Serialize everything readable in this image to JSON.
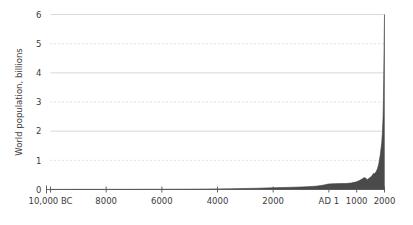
{
  "chart_data": {
    "type": "area",
    "title": "",
    "subtitle": "",
    "xlabel": "",
    "ylabel": "World population, billions",
    "xlim": [
      -10000,
      2000
    ],
    "ylim": [
      0,
      6
    ],
    "grid": true,
    "grid_solid_at": [
      2,
      4,
      6
    ],
    "grid_dotted_at": [
      1,
      3,
      5
    ],
    "legend": "none",
    "fill_color": "#4a4a4a",
    "line_color": "#3a3a3a",
    "grid_color": "#cfcfcf",
    "axis_color": "#555555",
    "background_color": "#ffffff",
    "xticks": [
      {
        "value": -10000,
        "label": "10,000 BC"
      },
      {
        "value": -8000,
        "label": "8000"
      },
      {
        "value": -6000,
        "label": "6000"
      },
      {
        "value": -4000,
        "label": "4000"
      },
      {
        "value": -2000,
        "label": "2000"
      },
      {
        "value": 1,
        "label": "AD 1"
      },
      {
        "value": 1000,
        "label": "1000"
      },
      {
        "value": 2000,
        "label": "2000"
      }
    ],
    "yticks": [
      {
        "value": 0,
        "label": "0"
      },
      {
        "value": 1,
        "label": "1"
      },
      {
        "value": 2,
        "label": "2"
      },
      {
        "value": 3,
        "label": "3"
      },
      {
        "value": 4,
        "label": "4"
      },
      {
        "value": 5,
        "label": "5"
      },
      {
        "value": 6,
        "label": "6"
      }
    ],
    "x": [
      -10000,
      -9500,
      -9000,
      -8500,
      -8000,
      -7500,
      -7000,
      -6500,
      -6000,
      -5500,
      -5000,
      -4500,
      -4000,
      -3500,
      -3000,
      -2500,
      -2000,
      -1500,
      -1000,
      -800,
      -600,
      -500,
      -400,
      -300,
      -200,
      -100,
      1,
      200,
      400,
      600,
      800,
      1000,
      1100,
      1200,
      1250,
      1300,
      1340,
      1360,
      1400,
      1450,
      1500,
      1550,
      1600,
      1650,
      1700,
      1750,
      1800,
      1850,
      1900,
      1925,
      1950,
      1960,
      1970,
      1980,
      1990,
      1999,
      2000
    ],
    "y": [
      0.004,
      0.004,
      0.005,
      0.005,
      0.005,
      0.006,
      0.007,
      0.008,
      0.009,
      0.01,
      0.012,
      0.015,
      0.02,
      0.026,
      0.035,
      0.045,
      0.06,
      0.072,
      0.085,
      0.095,
      0.106,
      0.112,
      0.12,
      0.135,
      0.15,
      0.17,
      0.19,
      0.2,
      0.202,
      0.206,
      0.22,
      0.265,
      0.31,
      0.36,
      0.4,
      0.396,
      0.39,
      0.33,
      0.35,
      0.39,
      0.425,
      0.47,
      0.545,
      0.545,
      0.61,
      0.72,
      0.9,
      1.2,
      1.6,
      1.95,
      2.52,
      3.02,
      3.7,
      4.43,
      5.27,
      5.98,
      6.0
    ],
    "series_name": "World population"
  },
  "annotations": {
    "spike_note": ""
  }
}
